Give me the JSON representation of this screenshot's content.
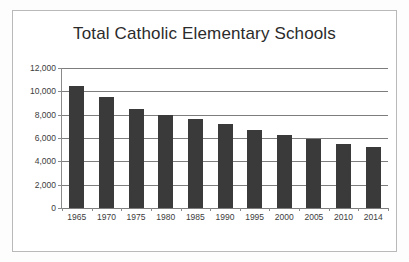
{
  "chart_data": {
    "type": "bar",
    "title": "Total Catholic Elementary Schools",
    "xlabel": "",
    "ylabel": "",
    "categories": [
      "1965",
      "1970",
      "1975",
      "1980",
      "1985",
      "1990",
      "1995",
      "2000",
      "2005",
      "2010",
      "2014"
    ],
    "values": [
      10500,
      9500,
      8500,
      8000,
      7600,
      7200,
      6700,
      6300,
      5900,
      5500,
      5200
    ],
    "ylim": [
      0,
      12000
    ],
    "ytick_values": [
      0,
      2000,
      4000,
      6000,
      8000,
      10000,
      12000
    ],
    "ytick_labels": [
      "0",
      "2,000",
      "4,000",
      "6,000",
      "8,000",
      "10,000",
      "12,000"
    ],
    "grid": true,
    "grid_axis": "y",
    "legend": false,
    "legend_position": "none",
    "bar_color": "#3a3a3a",
    "grid_color": "#7d7d7d",
    "axis_color": "#8a8a8a",
    "text_color": "#3c3c3c",
    "background_color": "#ffffff",
    "border_color": "#b9b9b9"
  }
}
